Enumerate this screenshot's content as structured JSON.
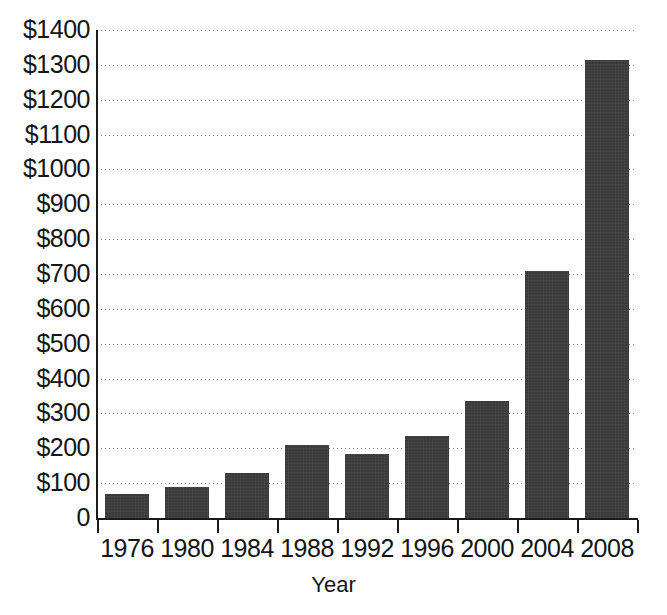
{
  "chart_data": {
    "type": "bar",
    "title": "",
    "subtitle": "",
    "xlabel": "Year",
    "ylabel": "",
    "categories": [
      "1976",
      "1980",
      "1984",
      "1988",
      "1992",
      "1996",
      "2000",
      "2004",
      "2008"
    ],
    "values": [
      70,
      90,
      130,
      210,
      185,
      235,
      335,
      710,
      1315
    ],
    "series": [
      {
        "name": "",
        "values": [
          70,
          90,
          130,
          210,
          185,
          235,
          335,
          710,
          1315
        ]
      }
    ],
    "ylim": [
      0,
      1400
    ],
    "ytick_values": [
      0,
      100,
      200,
      300,
      400,
      500,
      600,
      700,
      800,
      900,
      1000,
      1100,
      1200,
      1300,
      1400
    ],
    "ytick_labels": [
      "$1400",
      "$1300",
      "$1200",
      "$1100",
      "$1000",
      "$900",
      "$800",
      "$700",
      "$600",
      "$500",
      "$400",
      "$300",
      "$200",
      "$100",
      "0"
    ],
    "xtick_labels": [
      "1976",
      "1980",
      "1984",
      "1988",
      "1992",
      "1996",
      "2000",
      "2004",
      "2008"
    ],
    "grid": true,
    "grid_style": "dotted",
    "grid_axis": "y",
    "legend": false,
    "legend_position": "none",
    "annotations": [],
    "bar_color": "#3a3a3a",
    "grid_color": "#8d8d8d",
    "axis_color": "#1a1a1a",
    "background_color": "#ffffff"
  },
  "axes": {
    "x_title": "Year"
  }
}
